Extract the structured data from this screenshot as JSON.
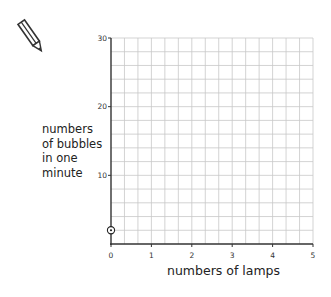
{
  "chart_data": {
    "type": "scatter",
    "title": "",
    "xlabel": "numbers of lamps",
    "ylabel_lines": [
      "numbers",
      "of bubbles",
      "in one",
      "minute"
    ],
    "ylabel": "numbers of bubbles in one minute",
    "xlim": [
      0,
      5
    ],
    "ylim": [
      0,
      30
    ],
    "x_ticks": [
      0,
      1,
      2,
      3,
      4,
      5
    ],
    "x_tick_labels": [
      "0",
      "1",
      "2",
      "3",
      "4",
      "5"
    ],
    "y_ticks": [
      10,
      20,
      30
    ],
    "y_tick_labels": [
      "10",
      "20",
      "30"
    ],
    "x_minor_step": 0.3333333,
    "y_minor_step": 2,
    "grid": true,
    "points": [
      {
        "x": 0,
        "y": 2,
        "marker": "circled-dot"
      }
    ],
    "colors": {
      "grid": "#c8c8c8",
      "axis": "#333333",
      "point": "#222222"
    }
  },
  "icons": {
    "pencil": "pencil-icon"
  }
}
